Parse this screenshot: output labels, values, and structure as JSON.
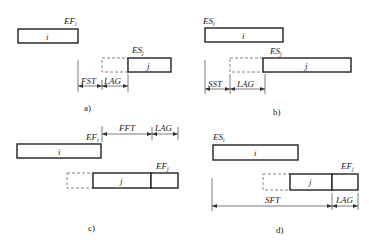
{
  "panels": {
    "a": {
      "caption": "a)",
      "box_i_label": "i",
      "box_j_label": "j",
      "top_label": "EF",
      "top_label_sub": "i",
      "j_label": "ES",
      "j_label_sub": "j",
      "dim_1": "FST",
      "dim_2": "LAG"
    },
    "b": {
      "caption": "b)",
      "box_i_label": "i",
      "box_j_label": "j",
      "top_label": "ES",
      "top_label_sub": "i",
      "j_label": "ES",
      "j_label_sub": "j",
      "dim_1": "SST",
      "dim_2": "LAG"
    },
    "c": {
      "caption": "c)",
      "box_i_label": "i",
      "box_j_label": "j",
      "top_label": "EF",
      "top_label_sub": "i",
      "j_label": "EF",
      "j_label_sub": "j",
      "dim_1": "FFT",
      "dim_2": "LAG"
    },
    "d": {
      "caption": "d)",
      "box_i_label": "i",
      "box_j_label": "j",
      "top_label": "ES",
      "top_label_sub": "i",
      "j_label": "EF",
      "j_label_sub": "j",
      "dim_1": "SFT",
      "dim_2": "LAG"
    }
  }
}
